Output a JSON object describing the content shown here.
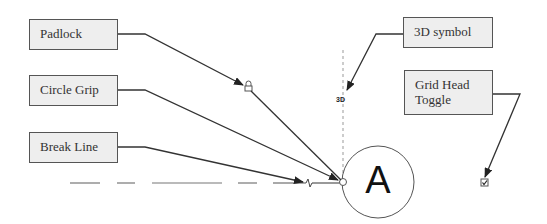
{
  "callouts": {
    "padlock": "Padlock",
    "circle_grip": "Circle Grip",
    "break_line": "Break Line",
    "symbol_3d": "3D symbol",
    "grid_head_toggle": "Grid Head Toggle"
  },
  "grid": {
    "bubble_label": "A",
    "symbol_3d_text": "3D"
  },
  "colors": {
    "box_fill": "#eeeeee",
    "box_border": "#555555",
    "leader": "#333333",
    "grid_line": "#888888"
  }
}
